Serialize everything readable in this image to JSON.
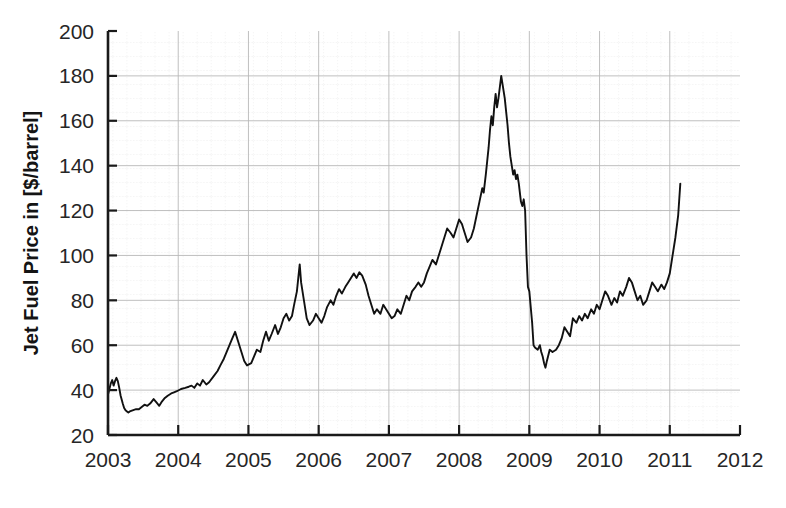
{
  "chart_data": {
    "type": "line",
    "title": "",
    "xlabel": "",
    "ylabel": "Jet Fuel Price in [$/barrel]",
    "xlim": [
      2003,
      2012
    ],
    "ylim": [
      20,
      200
    ],
    "xticks": [
      "2003",
      "2004",
      "2005",
      "2006",
      "2007",
      "2008",
      "2009",
      "2010",
      "2011",
      "2012"
    ],
    "yticks": [
      "20",
      "40",
      "60",
      "80",
      "100",
      "120",
      "140",
      "160",
      "180",
      "200"
    ],
    "grid": true,
    "legend": "none",
    "line_color": "#111111",
    "series": [
      {
        "name": "Jet Fuel Price",
        "x": [
          2003.0,
          2003.02,
          2003.04,
          2003.06,
          2003.08,
          2003.1,
          2003.12,
          2003.14,
          2003.16,
          2003.18,
          2003.21,
          2003.23,
          2003.25,
          2003.27,
          2003.29,
          2003.31,
          2003.35,
          2003.4,
          2003.44,
          2003.48,
          2003.52,
          2003.56,
          2003.6,
          2003.65,
          2003.69,
          2003.73,
          2003.77,
          2003.81,
          2003.85,
          2003.9,
          2003.94,
          2003.98,
          2004.04,
          2004.1,
          2004.15,
          2004.19,
          2004.23,
          2004.27,
          2004.31,
          2004.35,
          2004.4,
          2004.44,
          2004.5,
          2004.56,
          2004.6,
          2004.65,
          2004.69,
          2004.73,
          2004.77,
          2004.81,
          2004.85,
          2004.9,
          2004.94,
          2004.98,
          2005.04,
          2005.08,
          2005.12,
          2005.17,
          2005.21,
          2005.25,
          2005.29,
          2005.33,
          2005.38,
          2005.42,
          2005.46,
          2005.5,
          2005.54,
          2005.58,
          2005.62,
          2005.65,
          2005.69,
          2005.71,
          2005.73,
          2005.75,
          2005.79,
          2005.83,
          2005.87,
          2005.92,
          2005.96,
          2006.0,
          2006.04,
          2006.08,
          2006.12,
          2006.17,
          2006.21,
          2006.25,
          2006.29,
          2006.33,
          2006.38,
          2006.42,
          2006.46,
          2006.5,
          2006.54,
          2006.58,
          2006.62,
          2006.67,
          2006.71,
          2006.75,
          2006.79,
          2006.83,
          2006.88,
          2006.92,
          2006.96,
          2007.0,
          2007.04,
          2007.08,
          2007.12,
          2007.17,
          2007.21,
          2007.25,
          2007.29,
          2007.33,
          2007.38,
          2007.42,
          2007.46,
          2007.5,
          2007.54,
          2007.58,
          2007.62,
          2007.67,
          2007.71,
          2007.75,
          2007.79,
          2007.83,
          2007.88,
          2007.92,
          2007.96,
          2008.0,
          2008.04,
          2008.08,
          2008.12,
          2008.17,
          2008.21,
          2008.25,
          2008.29,
          2008.33,
          2008.35,
          2008.38,
          2008.4,
          2008.42,
          2008.44,
          2008.46,
          2008.48,
          2008.5,
          2008.52,
          2008.54,
          2008.56,
          2008.58,
          2008.6,
          2008.62,
          2008.65,
          2008.67,
          2008.69,
          2008.71,
          2008.73,
          2008.75,
          2008.77,
          2008.79,
          2008.81,
          2008.83,
          2008.85,
          2008.88,
          2008.9,
          2008.92,
          2008.94,
          2008.96,
          2008.98,
          2009.0,
          2009.04,
          2009.06,
          2009.08,
          2009.12,
          2009.15,
          2009.17,
          2009.19,
          2009.21,
          2009.23,
          2009.25,
          2009.29,
          2009.33,
          2009.38,
          2009.42,
          2009.46,
          2009.5,
          2009.54,
          2009.58,
          2009.62,
          2009.67,
          2009.71,
          2009.75,
          2009.79,
          2009.83,
          2009.88,
          2009.92,
          2009.96,
          2010.0,
          2010.04,
          2010.08,
          2010.12,
          2010.17,
          2010.21,
          2010.25,
          2010.29,
          2010.33,
          2010.38,
          2010.42,
          2010.46,
          2010.5,
          2010.54,
          2010.58,
          2010.62,
          2010.67,
          2010.71,
          2010.75,
          2010.79,
          2010.83,
          2010.88,
          2010.92,
          2010.96,
          2011.0,
          2011.04,
          2011.08,
          2011.12,
          2011.15
        ],
        "y": [
          38.0,
          40.5,
          43.0,
          44.5,
          42.0,
          44.0,
          45.5,
          44.0,
          41.0,
          37.5,
          34.0,
          32.0,
          31.0,
          30.5,
          30.0,
          30.5,
          31.0,
          31.5,
          31.5,
          32.5,
          33.5,
          33.0,
          34.0,
          36.0,
          34.5,
          33.0,
          35.0,
          36.5,
          37.5,
          38.5,
          39.0,
          39.5,
          40.5,
          41.0,
          41.5,
          42.0,
          41.0,
          43.0,
          42.0,
          44.5,
          42.5,
          43.5,
          46.0,
          48.5,
          51.0,
          54.0,
          57.0,
          60.0,
          63.0,
          66.0,
          62.0,
          57.0,
          53.0,
          51.0,
          52.0,
          55.0,
          58.0,
          57.0,
          62.0,
          66.0,
          62.0,
          65.0,
          69.0,
          65.0,
          68.0,
          72.0,
          74.0,
          71.0,
          73.0,
          78.0,
          84.0,
          90.0,
          96.0,
          88.0,
          80.0,
          72.0,
          69.0,
          71.0,
          74.0,
          72.0,
          70.0,
          73.0,
          77.0,
          80.0,
          78.0,
          82.0,
          85.0,
          83.0,
          86.0,
          88.0,
          90.0,
          92.0,
          90.0,
          92.5,
          91.0,
          87.0,
          82.0,
          78.0,
          74.0,
          76.0,
          74.0,
          78.0,
          76.0,
          74.0,
          72.0,
          73.0,
          76.0,
          74.0,
          78.0,
          82.0,
          80.0,
          84.0,
          86.0,
          88.0,
          86.0,
          88.0,
          92.0,
          95.0,
          98.0,
          96.0,
          100.0,
          104.0,
          108.0,
          112.0,
          110.0,
          108.0,
          112.0,
          116.0,
          114.0,
          110.0,
          106.0,
          108.0,
          112.0,
          118.0,
          124.0,
          130.0,
          128.0,
          136.0,
          142.0,
          148.0,
          156.0,
          162.0,
          158.0,
          166.0,
          172.0,
          166.0,
          170.0,
          175.0,
          180.0,
          176.0,
          170.0,
          164.0,
          158.0,
          150.0,
          144.0,
          140.0,
          136.0,
          138.0,
          134.0,
          136.0,
          132.0,
          124.0,
          122.0,
          125.0,
          120.0,
          100.0,
          86.0,
          84.0,
          70.0,
          60.0,
          59.0,
          58.0,
          60.0,
          57.0,
          55.0,
          52.0,
          50.0,
          53.0,
          58.0,
          57.0,
          58.0,
          60.0,
          63.0,
          68.0,
          66.0,
          64.0,
          72.0,
          70.0,
          73.0,
          71.0,
          74.0,
          72.0,
          76.0,
          74.0,
          78.0,
          76.0,
          80.0,
          84.0,
          82.0,
          78.0,
          81.0,
          79.0,
          84.0,
          82.0,
          86.0,
          90.0,
          88.0,
          84.0,
          80.0,
          82.0,
          78.0,
          80.0,
          84.0,
          88.0,
          86.0,
          84.0,
          87.0,
          85.0,
          88.0,
          92.0,
          100.0,
          108.0,
          118.0,
          132.0
        ]
      }
    ]
  },
  "axis": {
    "y_title": "Jet Fuel Price in [$/barrel]"
  }
}
